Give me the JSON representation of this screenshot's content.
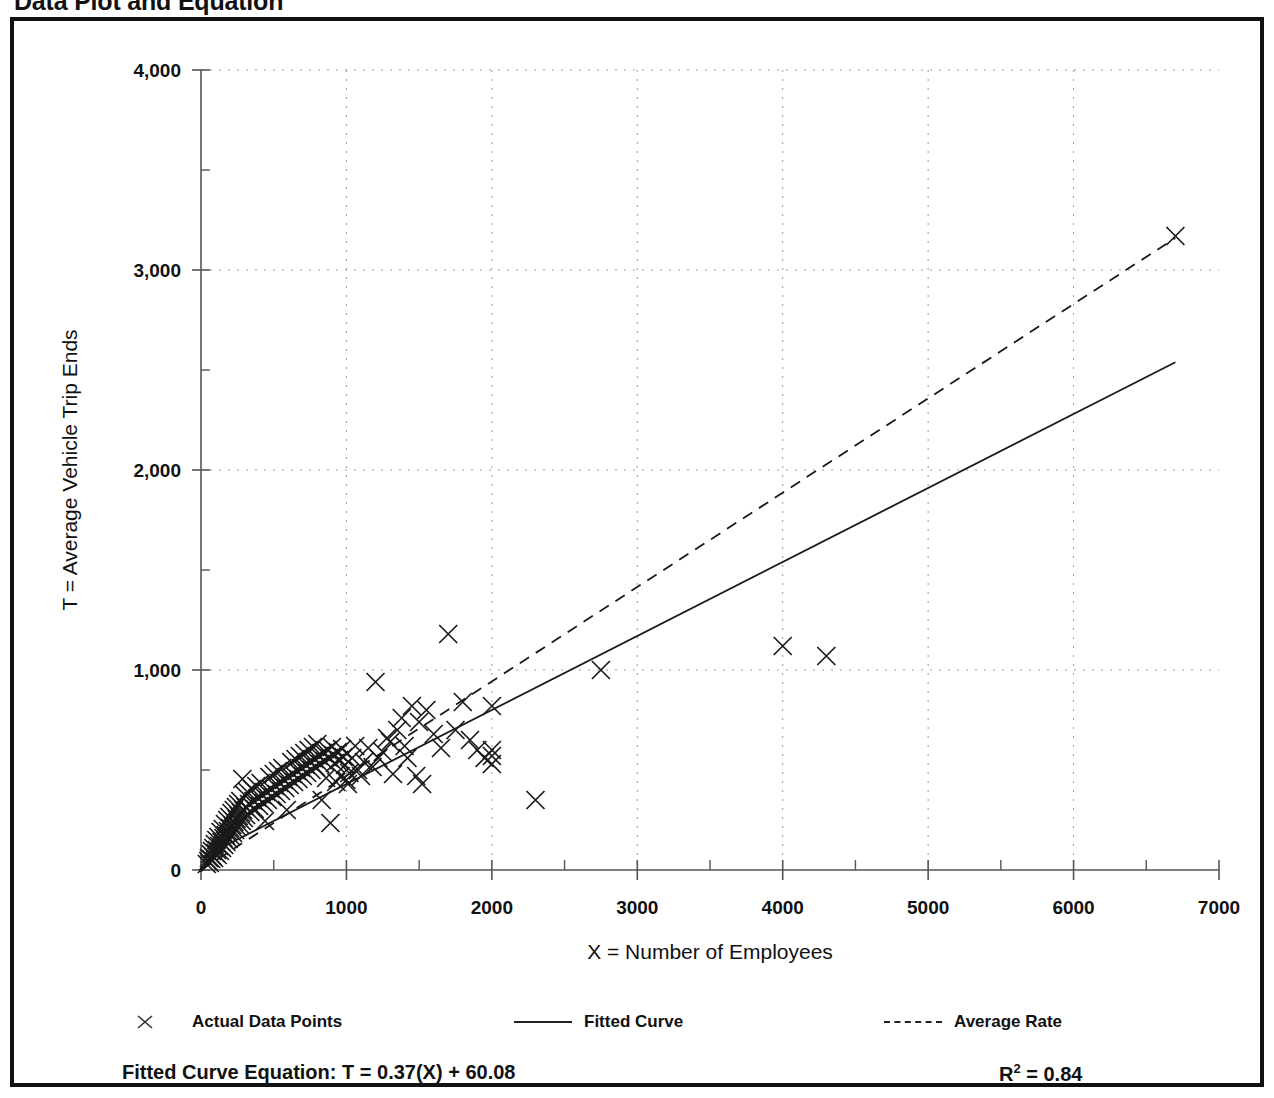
{
  "page": {
    "title": "Data Plot and Equation"
  },
  "legend": {
    "items": [
      {
        "label": "Actual Data Points",
        "marker": "x-marker-icon"
      },
      {
        "label": "Fitted Curve",
        "marker": "solid-line-icon"
      },
      {
        "label": "Average Rate",
        "marker": "dashed-line-icon"
      }
    ]
  },
  "equation": {
    "fitted_label": "Fitted Curve Equation:  T = 0.37(X) + 60.08",
    "r_squared_prefix": "R",
    "r_squared_exp": "2",
    "r_squared_value": " = 0.84"
  },
  "chart_data": {
    "type": "scatter",
    "title": "",
    "xlabel": "X = Number of Employees",
    "ylabel": "T = Average Vehicle Trip Ends",
    "xlim": [
      0,
      7000
    ],
    "ylim": [
      0,
      4000
    ],
    "xticks": [
      0,
      1000,
      2000,
      3000,
      4000,
      5000,
      6000,
      7000
    ],
    "xticklabels": [
      "0",
      "1000",
      "2000",
      "3000",
      "4000",
      "5000",
      "6000",
      "7000"
    ],
    "yticks": [
      0,
      1000,
      2000,
      3000,
      4000
    ],
    "yticklabels": [
      "0",
      "1,000",
      "2,000",
      "3,000",
      "4,000"
    ],
    "xminor_step": 500,
    "yminor_step": 500,
    "grid": true,
    "grid_style": "dotted",
    "grid_color": "#9a9a9a",
    "legend_position": "below-axes",
    "series": [
      {
        "name": "Actual Data Points",
        "type": "scatter",
        "marker": "x",
        "color": "#1a1a1a",
        "points": [
          [
            40,
            30
          ],
          [
            50,
            45
          ],
          [
            55,
            60
          ],
          [
            60,
            35
          ],
          [
            65,
            80
          ],
          [
            70,
            55
          ],
          [
            75,
            95
          ],
          [
            80,
            70
          ],
          [
            85,
            110
          ],
          [
            90,
            60
          ],
          [
            95,
            130
          ],
          [
            100,
            85
          ],
          [
            105,
            150
          ],
          [
            110,
            100
          ],
          [
            115,
            75
          ],
          [
            120,
            165
          ],
          [
            125,
            120
          ],
          [
            130,
            95
          ],
          [
            135,
            190
          ],
          [
            140,
            140
          ],
          [
            145,
            110
          ],
          [
            150,
            205
          ],
          [
            155,
            160
          ],
          [
            160,
            125
          ],
          [
            165,
            230
          ],
          [
            170,
            175
          ],
          [
            175,
            140
          ],
          [
            180,
            250
          ],
          [
            185,
            195
          ],
          [
            190,
            155
          ],
          [
            195,
            265
          ],
          [
            200,
            210
          ],
          [
            205,
            170
          ],
          [
            210,
            285
          ],
          [
            215,
            225
          ],
          [
            220,
            185
          ],
          [
            225,
            300
          ],
          [
            230,
            240
          ],
          [
            235,
            200
          ],
          [
            240,
            315
          ],
          [
            245,
            255
          ],
          [
            250,
            215
          ],
          [
            255,
            330
          ],
          [
            260,
            270
          ],
          [
            265,
            230
          ],
          [
            270,
            345
          ],
          [
            275,
            285
          ],
          [
            280,
            245
          ],
          [
            285,
            455
          ],
          [
            290,
            300
          ],
          [
            295,
            260
          ],
          [
            300,
            375
          ],
          [
            305,
            315
          ],
          [
            310,
            275
          ],
          [
            320,
            390
          ],
          [
            330,
            330
          ],
          [
            340,
            290
          ],
          [
            350,
            405
          ],
          [
            360,
            345
          ],
          [
            370,
            305
          ],
          [
            380,
            420
          ],
          [
            390,
            360
          ],
          [
            400,
            320
          ],
          [
            410,
            435
          ],
          [
            420,
            375
          ],
          [
            430,
            335
          ],
          [
            440,
            245
          ],
          [
            450,
            390
          ],
          [
            460,
            350
          ],
          [
            470,
            465
          ],
          [
            480,
            405
          ],
          [
            490,
            365
          ],
          [
            500,
            480
          ],
          [
            510,
            420
          ],
          [
            520,
            380
          ],
          [
            530,
            495
          ],
          [
            540,
            435
          ],
          [
            550,
            395
          ],
          [
            560,
            510
          ],
          [
            570,
            450
          ],
          [
            580,
            410
          ],
          [
            590,
            300
          ],
          [
            600,
            465
          ],
          [
            610,
            425
          ],
          [
            620,
            540
          ],
          [
            630,
            480
          ],
          [
            640,
            440
          ],
          [
            650,
            555
          ],
          [
            660,
            495
          ],
          [
            670,
            455
          ],
          [
            680,
            570
          ],
          [
            690,
            510
          ],
          [
            700,
            470
          ],
          [
            710,
            585
          ],
          [
            720,
            525
          ],
          [
            730,
            485
          ],
          [
            740,
            600
          ],
          [
            750,
            540
          ],
          [
            760,
            500
          ],
          [
            770,
            615
          ],
          [
            780,
            555
          ],
          [
            790,
            515
          ],
          [
            800,
            630
          ],
          [
            810,
            570
          ],
          [
            820,
            530
          ],
          [
            830,
            350
          ],
          [
            840,
            585
          ],
          [
            850,
            545
          ],
          [
            860,
            460
          ],
          [
            870,
            600
          ],
          [
            880,
            560
          ],
          [
            890,
            235
          ],
          [
            900,
            615
          ],
          [
            910,
            575
          ],
          [
            920,
            535
          ],
          [
            930,
            440
          ],
          [
            940,
            590
          ],
          [
            950,
            550
          ],
          [
            960,
            470
          ],
          [
            970,
            605
          ],
          [
            980,
            565
          ],
          [
            990,
            525
          ],
          [
            1000,
            450
          ],
          [
            1010,
            430
          ],
          [
            1020,
            485
          ],
          [
            1040,
            560
          ],
          [
            1060,
            620
          ],
          [
            1080,
            500
          ],
          [
            1100,
            470
          ],
          [
            1120,
            540
          ],
          [
            1150,
            610
          ],
          [
            1180,
            515
          ],
          [
            1200,
            940
          ],
          [
            1220,
            560
          ],
          [
            1250,
            590
          ],
          [
            1280,
            660
          ],
          [
            1300,
            640
          ],
          [
            1320,
            480
          ],
          [
            1350,
            700
          ],
          [
            1380,
            760
          ],
          [
            1400,
            620
          ],
          [
            1420,
            560
          ],
          [
            1450,
            820
          ],
          [
            1480,
            470
          ],
          [
            1500,
            740
          ],
          [
            1520,
            430
          ],
          [
            1550,
            800
          ],
          [
            1600,
            680
          ],
          [
            1650,
            610
          ],
          [
            1700,
            1180
          ],
          [
            1750,
            700
          ],
          [
            1800,
            840
          ],
          [
            1850,
            650
          ],
          [
            1900,
            600
          ],
          [
            1950,
            560
          ],
          [
            2000,
            820
          ],
          [
            2000,
            600
          ],
          [
            2000,
            530
          ],
          [
            2000,
            570
          ],
          [
            2300,
            350
          ],
          [
            2750,
            1000
          ],
          [
            4000,
            1120
          ],
          [
            4300,
            1070
          ],
          [
            6700,
            3170
          ]
        ]
      },
      {
        "name": "Fitted Curve",
        "type": "line",
        "style": "solid",
        "color": "#1a1a1a",
        "equation": "T = 0.37(X) + 60.08",
        "slope": 0.37,
        "intercept": 60.08,
        "r_squared": 0.84,
        "endpoints": [
          [
            0,
            60.08
          ],
          [
            6700,
            2539.08
          ]
        ]
      },
      {
        "name": "Average Rate",
        "type": "line",
        "style": "dashed",
        "color": "#1a1a1a",
        "slope": 0.4716,
        "intercept": 0,
        "endpoints": [
          [
            0,
            0
          ],
          [
            6700,
            3160
          ]
        ]
      }
    ]
  }
}
